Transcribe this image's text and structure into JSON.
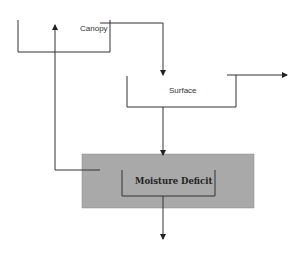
{
  "diagram": {
    "nodes": {
      "canopy": {
        "label": "Canopy"
      },
      "surface": {
        "label": "Surface"
      },
      "moisture_deficit": {
        "label": "Moisture Deficit",
        "fill": "#a9a9a9"
      }
    },
    "edges": [
      {
        "from": "canopy",
        "to": "surface",
        "label": ""
      },
      {
        "from": "surface",
        "to": "moisture_deficit",
        "label": ""
      },
      {
        "from": "moisture_deficit",
        "to": "canopy",
        "label": ""
      },
      {
        "from": "surface",
        "to": "outflow-right",
        "label": ""
      },
      {
        "from": "moisture_deficit",
        "to": "outflow-down",
        "label": ""
      }
    ]
  }
}
